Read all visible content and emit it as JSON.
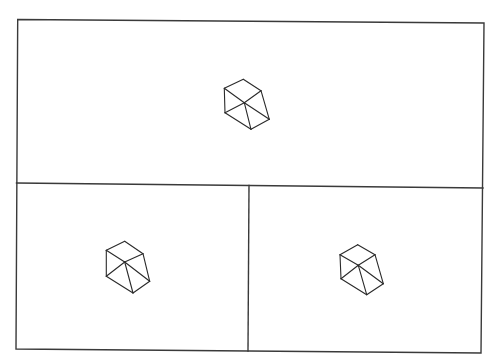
{
  "diagram": {
    "background": "#ffffff",
    "stroke_color": "#333333",
    "layout": "one wide top panel above two equal bottom panels, outer frame slightly rotated",
    "frame": {
      "corners": {
        "top_left": [
          17.7,
          19.5
        ],
        "top_right": [
          484,
          23
        ],
        "bottom_right": [
          481,
          353
        ],
        "bottom_left": [
          16,
          349
        ]
      },
      "horizontal_divider": {
        "from": [
          16.5,
          183
        ],
        "to": [
          483,
          188
        ]
      },
      "vertical_divider": {
        "from": [
          249,
          185.5
        ],
        "to": [
          248,
          351
        ]
      }
    },
    "panels": [
      {
        "id": "top",
        "glyph": "hexagonal-wireframe-cube",
        "vertices": {
          "T": [
            243.3,
            79.3
          ],
          "UL": [
            224.3,
            88.3
          ],
          "UR": [
            261,
            90.7
          ],
          "C": [
            244.3,
            102.7
          ],
          "LL": [
            225,
            112.7
          ],
          "LR": [
            269.3,
            119.3
          ],
          "B": [
            251,
            129.3
          ]
        }
      },
      {
        "id": "bottom-left",
        "glyph": "hexagonal-wireframe-cube",
        "vertices": {
          "T": [
            124.7,
            241.3
          ],
          "UL": [
            106.3,
            250.3
          ],
          "UR": [
            143,
            253.7
          ],
          "C": [
            124.7,
            262
          ],
          "LL": [
            106.3,
            276.3
          ],
          "LR": [
            149.7,
            281.3
          ],
          "B": [
            133,
            293
          ]
        }
      },
      {
        "id": "bottom-right",
        "glyph": "hexagonal-wireframe-cube",
        "vertices": {
          "T": [
            357.7,
            244.7
          ],
          "UL": [
            340,
            254.7
          ],
          "UR": [
            375,
            254.7
          ],
          "C": [
            358.3,
            265.3
          ],
          "LL": [
            341,
            278.7
          ],
          "LR": [
            383.3,
            283.7
          ],
          "B": [
            366.7,
            294.7
          ]
        }
      }
    ],
    "glyph_edges": [
      [
        "T",
        "UL"
      ],
      [
        "T",
        "UR"
      ],
      [
        "UR",
        "LR"
      ],
      [
        "LR",
        "B"
      ],
      [
        "B",
        "LL"
      ],
      [
        "LL",
        "UL"
      ],
      [
        "C",
        "UL"
      ],
      [
        "C",
        "UR"
      ],
      [
        "C",
        "LL"
      ],
      [
        "C",
        "B"
      ],
      [
        "C",
        "LR"
      ]
    ]
  }
}
